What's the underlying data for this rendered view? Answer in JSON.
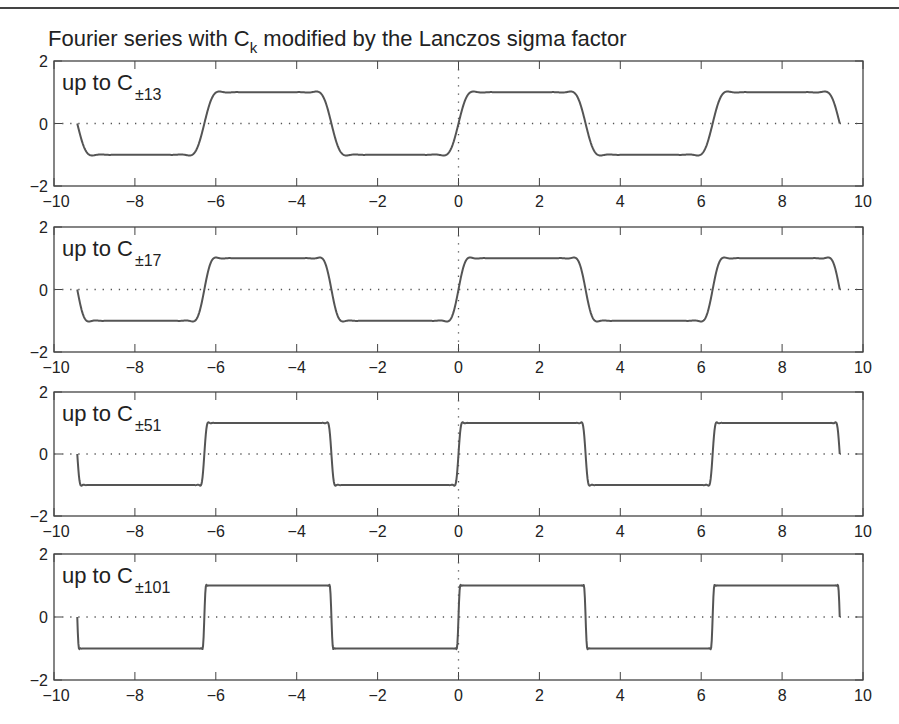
{
  "header": {
    "title_prefix": "Fourier series with C",
    "title_sub": "k",
    "title_suffix": " modified by the Lanczos sigma factor"
  },
  "colors": {
    "curve": "#555555",
    "axes": "#444444",
    "grid_dotted": "#555555",
    "text": "#222222",
    "background": "#ffffff"
  },
  "chart_data": [
    {
      "type": "line",
      "title": "Fourier series with C_k modified by the Lanczos sigma factor",
      "label_prefix": "up to C",
      "label_sub": "±13",
      "N": 13,
      "xlim": [
        -10,
        10
      ],
      "ylim": [
        -2,
        2
      ],
      "x_range_plotted": [
        -9.4248,
        9.4248
      ],
      "xticks": [
        -10,
        -8,
        -6,
        -4,
        -2,
        0,
        2,
        4,
        6,
        8,
        10
      ],
      "yticks": [
        -2,
        0,
        2
      ],
      "description": "Lanczos-sigma-smoothed partial Fourier sum of a square wave (+1 on (0,π), -1 on (π,2π)), period 2π; smooth transitions with small ripple",
      "reference_lines": [
        "y=0 dotted",
        "x=0 dotted"
      ]
    },
    {
      "type": "line",
      "label_prefix": "up to C",
      "label_sub": "±17",
      "N": 17,
      "xlim": [
        -10,
        10
      ],
      "ylim": [
        -2,
        2
      ],
      "x_range_plotted": [
        -9.4248,
        9.4248
      ],
      "xticks": [
        -10,
        -8,
        -6,
        -4,
        -2,
        0,
        2,
        4,
        6,
        8,
        10
      ],
      "yticks": [
        -2,
        0,
        2
      ],
      "reference_lines": [
        "y=0 dotted",
        "x=0 dotted"
      ]
    },
    {
      "type": "line",
      "label_prefix": "up to C",
      "label_sub": "±51",
      "N": 51,
      "xlim": [
        -10,
        10
      ],
      "ylim": [
        -2,
        2
      ],
      "x_range_plotted": [
        -9.4248,
        9.4248
      ],
      "xticks": [
        -10,
        -8,
        -6,
        -4,
        -2,
        0,
        2,
        4,
        6,
        8,
        10
      ],
      "yticks": [
        -2,
        0,
        2
      ],
      "reference_lines": [
        "y=0 dotted",
        "x=0 dotted"
      ]
    },
    {
      "type": "line",
      "label_prefix": "up to C",
      "label_sub": "±101",
      "N": 101,
      "xlim": [
        -10,
        10
      ],
      "ylim": [
        -2,
        2
      ],
      "x_range_plotted": [
        -9.4248,
        9.4248
      ],
      "xticks": [
        -10,
        -8,
        -6,
        -4,
        -2,
        0,
        2,
        4,
        6,
        8,
        10
      ],
      "yticks": [
        -2,
        0,
        2
      ],
      "reference_lines": [
        "y=0 dotted",
        "x=0 dotted"
      ]
    }
  ],
  "layout": {
    "x_left_px": 54,
    "x_right_px": 863,
    "panels_px": [
      {
        "top": 61,
        "bottom": 186
      },
      {
        "top": 227,
        "bottom": 352
      },
      {
        "top": 392,
        "bottom": 516
      },
      {
        "top": 554,
        "bottom": 680
      }
    ]
  }
}
